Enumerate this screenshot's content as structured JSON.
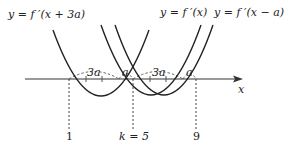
{
  "figure": {
    "curve_labels": {
      "left": "y = f ′(x + 3a)",
      "middle": "y = f ′(x)",
      "right": "y = f ′(x − a)"
    },
    "axis_label": "x",
    "gap_labels": [
      "3a",
      "a",
      "3a",
      "a"
    ],
    "bottom_labels": {
      "left": "1",
      "middle": "k = 5",
      "right": "9"
    }
  }
}
